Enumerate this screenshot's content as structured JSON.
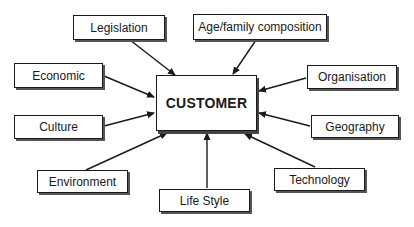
{
  "diagram": {
    "type": "hub-and-spoke influence diagram",
    "center": {
      "label": "CUSTOMER",
      "box": [
        156,
        75,
        101,
        56
      ]
    },
    "factors": [
      {
        "id": "legislation",
        "label": "Legislation",
        "box": [
          73,
          15,
          92,
          25
        ]
      },
      {
        "id": "age-family",
        "label": "Age/family composition",
        "box": [
          193,
          14,
          134,
          26
        ]
      },
      {
        "id": "economic",
        "label": "Economic",
        "box": [
          14,
          63,
          89,
          25
        ]
      },
      {
        "id": "organisation",
        "label": "Organisation",
        "box": [
          307,
          65,
          90,
          24
        ]
      },
      {
        "id": "culture",
        "label": "Culture",
        "box": [
          14,
          115,
          89,
          24
        ]
      },
      {
        "id": "geography",
        "label": "Geography",
        "box": [
          311,
          115,
          88,
          23
        ]
      },
      {
        "id": "environment",
        "label": "Environment",
        "box": [
          37,
          170,
          91,
          23
        ]
      },
      {
        "id": "technology",
        "label": "Technology",
        "box": [
          274,
          168,
          91,
          23
        ]
      },
      {
        "id": "life-style",
        "label": "Life Style",
        "box": [
          159,
          189,
          91,
          23
        ]
      }
    ],
    "edges": [
      {
        "from": "legislation",
        "to": "customer",
        "line": [
          130,
          40,
          175,
          75
        ]
      },
      {
        "from": "age-family",
        "to": "customer",
        "line": [
          256,
          40,
          233,
          74
        ]
      },
      {
        "from": "economic",
        "to": "customer",
        "line": [
          104,
          76,
          154,
          97
        ]
      },
      {
        "from": "organisation",
        "to": "customer",
        "line": [
          306,
          78,
          259,
          91
        ]
      },
      {
        "from": "culture",
        "to": "customer",
        "line": [
          104,
          126,
          154,
          113
        ]
      },
      {
        "from": "geography",
        "to": "customer",
        "line": [
          310,
          126,
          259,
          113
        ]
      },
      {
        "from": "environment",
        "to": "customer",
        "line": [
          86,
          170,
          167,
          133
        ]
      },
      {
        "from": "technology",
        "to": "customer",
        "line": [
          315,
          167,
          245,
          134
        ]
      },
      {
        "from": "life-style",
        "to": "customer",
        "line": [
          207,
          188,
          207,
          133
        ]
      }
    ],
    "colors": {
      "line": "#1a1a1a",
      "box_border": "#1a1a1a",
      "shadow": "#555555",
      "background": "#ffffff"
    }
  }
}
